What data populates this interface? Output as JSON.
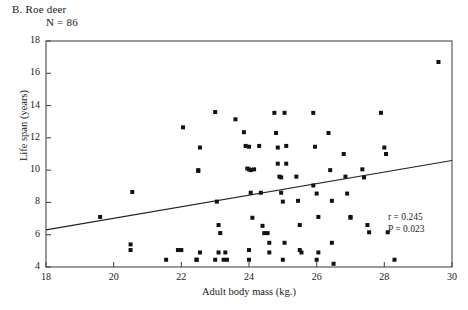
{
  "panel": {
    "title": "B. Roe deer",
    "n_label": "N = 86"
  },
  "annotations": {
    "r": "r = 0.245",
    "p": "P = 0.023"
  },
  "colors": {
    "axis": "#4a4a4a",
    "point": "#111111",
    "line": "#222222",
    "background": "#ffffff"
  },
  "chart_data": {
    "type": "scatter",
    "title": "B. Roe deer",
    "xlabel": "Adult body mass (kg.)",
    "ylabel": "Life span (years)",
    "xlim": [
      18,
      30
    ],
    "ylim": [
      4,
      18
    ],
    "xticks": [
      18,
      20,
      22,
      24,
      26,
      28,
      30
    ],
    "yticks": [
      4,
      6,
      8,
      10,
      12,
      14,
      16,
      18
    ],
    "grid": false,
    "legend": null,
    "n": 86,
    "correlation_r": 0.245,
    "p_value": 0.023,
    "regression_line": {
      "x": [
        18,
        30
      ],
      "y": [
        6.3,
        10.6
      ]
    },
    "points": [
      [
        19.6,
        7.1
      ],
      [
        20.55,
        8.65
      ],
      [
        20.5,
        5.4
      ],
      [
        20.5,
        5.05
      ],
      [
        21.55,
        4.45
      ],
      [
        21.9,
        5.05
      ],
      [
        22.05,
        12.65
      ],
      [
        22.0,
        5.05
      ],
      [
        22.45,
        4.45
      ],
      [
        22.5,
        10.0
      ],
      [
        22.5,
        9.95
      ],
      [
        22.55,
        11.4
      ],
      [
        22.55,
        4.9
      ],
      [
        22.45,
        4.45
      ],
      [
        23.0,
        13.6
      ],
      [
        23.0,
        4.45
      ],
      [
        23.1,
        4.9
      ],
      [
        23.3,
        4.9
      ],
      [
        23.25,
        4.45
      ],
      [
        23.35,
        4.45
      ],
      [
        23.05,
        8.05
      ],
      [
        23.1,
        6.6
      ],
      [
        23.15,
        6.1
      ],
      [
        23.6,
        13.15
      ],
      [
        23.85,
        12.35
      ],
      [
        23.9,
        11.5
      ],
      [
        23.95,
        10.1
      ],
      [
        24.0,
        10.05
      ],
      [
        24.05,
        10.0
      ],
      [
        24.15,
        10.05
      ],
      [
        24.0,
        11.45
      ],
      [
        24.05,
        8.6
      ],
      [
        24.1,
        7.05
      ],
      [
        24.0,
        4.45
      ],
      [
        24.0,
        5.05
      ],
      [
        24.3,
        11.5
      ],
      [
        24.35,
        8.6
      ],
      [
        24.4,
        6.55
      ],
      [
        24.45,
        6.1
      ],
      [
        24.55,
        6.1
      ],
      [
        24.6,
        5.5
      ],
      [
        24.6,
        4.9
      ],
      [
        24.75,
        13.55
      ],
      [
        24.8,
        12.3
      ],
      [
        24.85,
        11.4
      ],
      [
        24.85,
        10.4
      ],
      [
        24.9,
        9.6
      ],
      [
        24.95,
        9.55
      ],
      [
        24.95,
        8.6
      ],
      [
        25.0,
        8.05
      ],
      [
        25.05,
        13.55
      ],
      [
        25.1,
        11.5
      ],
      [
        25.1,
        10.4
      ],
      [
        25.05,
        5.5
      ],
      [
        25.0,
        4.45
      ],
      [
        25.4,
        9.6
      ],
      [
        25.45,
        8.1
      ],
      [
        25.5,
        6.6
      ],
      [
        25.5,
        5.05
      ],
      [
        25.55,
        4.9
      ],
      [
        25.9,
        13.55
      ],
      [
        25.95,
        11.45
      ],
      [
        25.9,
        9.05
      ],
      [
        26.0,
        8.55
      ],
      [
        26.05,
        7.1
      ],
      [
        26.0,
        4.45
      ],
      [
        26.05,
        4.9
      ],
      [
        26.35,
        12.3
      ],
      [
        26.4,
        10.0
      ],
      [
        26.45,
        8.1
      ],
      [
        26.5,
        4.2
      ],
      [
        26.45,
        5.5
      ],
      [
        26.8,
        11.0
      ],
      [
        26.85,
        9.6
      ],
      [
        26.9,
        8.55
      ],
      [
        27.0,
        7.1
      ],
      [
        27.0,
        7.05
      ],
      [
        27.35,
        10.05
      ],
      [
        27.4,
        9.55
      ],
      [
        27.5,
        6.6
      ],
      [
        27.55,
        6.15
      ],
      [
        27.9,
        13.55
      ],
      [
        28.0,
        11.4
      ],
      [
        28.05,
        11.0
      ],
      [
        28.1,
        6.15
      ],
      [
        28.3,
        4.45
      ],
      [
        29.6,
        16.7
      ]
    ]
  },
  "axis_labels": {
    "x": "Adult body mass (kg.)",
    "y": "Life span (years)"
  }
}
